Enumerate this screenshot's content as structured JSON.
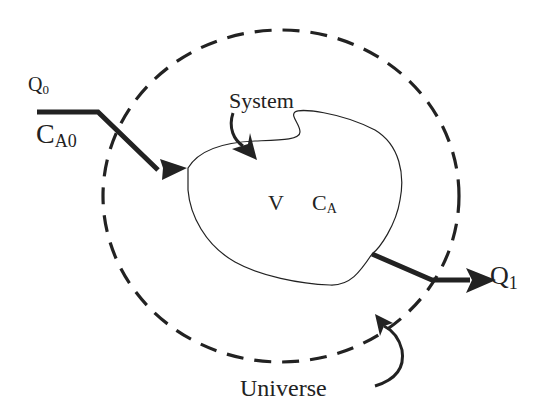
{
  "diagram": {
    "type": "control-volume / system-universe schematic",
    "labels": {
      "inlet_flow": "Q",
      "inlet_flow_sub": "0",
      "inlet_conc": "C",
      "inlet_conc_sub": "A0",
      "system": "System",
      "volume": "V",
      "system_conc": "C",
      "system_conc_sub": "A",
      "outlet_flow": "Q",
      "outlet_flow_sub": "1",
      "universe": "Universe"
    },
    "colors": {
      "ink": "#222222",
      "background": "#ffffff"
    },
    "elements": [
      {
        "id": "universe-boundary",
        "shape": "dashed ellipse"
      },
      {
        "id": "system-boundary",
        "shape": "closed irregular curve"
      },
      {
        "id": "inlet-stream",
        "shape": "thick arrow into system"
      },
      {
        "id": "outlet-stream",
        "shape": "thick arrow out of system"
      },
      {
        "id": "system-pointer",
        "shape": "curved arrow from System label"
      },
      {
        "id": "universe-pointer",
        "shape": "curved arrow from Universe label"
      }
    ]
  }
}
